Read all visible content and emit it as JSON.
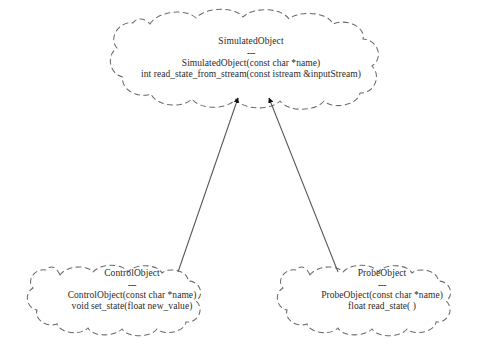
{
  "diagram": {
    "type": "uml-class-inheritance",
    "background_color": "#ffffff",
    "line_color": "#555555",
    "text_color": "#2a2a2a",
    "separator": "---",
    "classes": [
      {
        "id": "simulated-object",
        "name": "SimulatedObject",
        "role": "base-class",
        "members": [
          "SimulatedObject(const char *name)",
          "int read_state_from_stream(const istream &inputStream)"
        ]
      },
      {
        "id": "control-object",
        "name": "ControlObject",
        "role": "derived-class",
        "members": [
          "ControlObject(const char *name)",
          "void set_state(float new_value)"
        ]
      },
      {
        "id": "probe-object",
        "name": "ProbeObject",
        "role": "derived-class",
        "members": [
          "ProbeObject(const char *name)",
          "float read_state( )"
        ]
      }
    ],
    "relationships": [
      {
        "id": "control-inherits-simulated",
        "kind": "inheritance",
        "from": "ControlObject",
        "to": "SimulatedObject",
        "arrowhead": "filled-triangle"
      },
      {
        "id": "probe-inherits-simulated",
        "kind": "inheritance",
        "from": "ProbeObject",
        "to": "SimulatedObject",
        "arrowhead": "filled-triangle"
      }
    ]
  }
}
